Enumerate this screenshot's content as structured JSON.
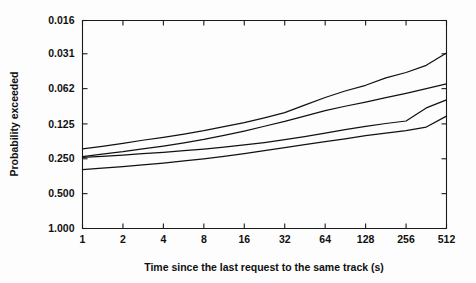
{
  "chart_data": {
    "type": "line",
    "title": "",
    "subtitle": "",
    "xlabel": "Time since the last request to the same track (s)",
    "ylabel": "Probability exceeded",
    "x_scale": "log2",
    "y_scale": "log2-inverted",
    "grid": false,
    "legend": "none",
    "xlim": [
      1,
      512
    ],
    "ylim": [
      0.016,
      1.0
    ],
    "x_ticks": [
      1,
      2,
      4,
      8,
      16,
      32,
      64,
      128,
      256,
      512
    ],
    "x_tick_labels": [
      "1",
      "2",
      "4",
      "8",
      "16",
      "32",
      "64",
      "128",
      "256",
      "512"
    ],
    "y_ticks": [
      0.016,
      0.031,
      0.062,
      0.125,
      0.25,
      0.5,
      1.0
    ],
    "y_tick_labels": [
      "0.016",
      "0.031",
      "0.062",
      "0.125",
      "0.250",
      "0.500",
      "1.000"
    ],
    "x": [
      1,
      1.4,
      2,
      2.8,
      4,
      5.7,
      8,
      11.3,
      16,
      22.6,
      32,
      45,
      64,
      90,
      128,
      181,
      256,
      362,
      512
    ],
    "series": [
      {
        "name": "curve-1",
        "values": [
          0.205,
          0.195,
          0.184,
          0.173,
          0.163,
          0.153,
          0.143,
          0.132,
          0.122,
          0.111,
          0.1,
          0.086,
          0.074,
          0.065,
          0.058,
          0.05,
          0.045,
          0.039,
          0.0305
        ]
      },
      {
        "name": "curve-2",
        "values": [
          0.239,
          0.228,
          0.217,
          0.205,
          0.194,
          0.182,
          0.17,
          0.157,
          0.144,
          0.131,
          0.119,
          0.107,
          0.096,
          0.088,
          0.081,
          0.074,
          0.068,
          0.062,
          0.0565
        ]
      },
      {
        "name": "curve-3",
        "values": [
          0.243,
          0.238,
          0.232,
          0.226,
          0.22,
          0.213,
          0.206,
          0.198,
          0.19,
          0.181,
          0.171,
          0.161,
          0.15,
          0.14,
          0.131,
          0.124,
          0.118,
          0.091,
          0.0775
        ]
      },
      {
        "name": "curve-4",
        "values": [
          0.31,
          0.301,
          0.292,
          0.282,
          0.272,
          0.261,
          0.25,
          0.238,
          0.226,
          0.213,
          0.2,
          0.189,
          0.178,
          0.168,
          0.158,
          0.15,
          0.143,
          0.133,
          0.107
        ]
      }
    ],
    "annotations": []
  },
  "colors": {
    "background": "#fdfdfd",
    "axis": "#1a1a1a",
    "line": "#111111",
    "text": "#101010"
  }
}
